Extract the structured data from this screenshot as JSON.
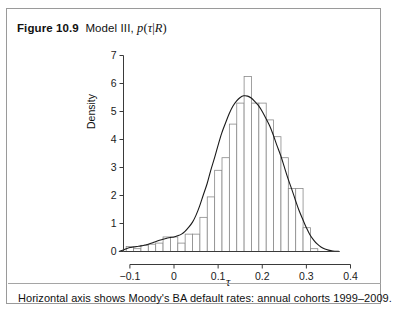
{
  "figure": {
    "number": "Figure 10.9",
    "title_prefix": "Model III,",
    "title_math_p": "p",
    "title_math_open": "(",
    "title_math_tau": "τ",
    "title_math_bar": "|",
    "title_math_R": "R",
    "title_math_close": ")",
    "bottom_caption": "Horizontal axis shows Moody's BA default rates: annual cohorts 1999–2009."
  },
  "chart_data": {
    "type": "bar",
    "xlabel": "τ",
    "ylabel": "Density",
    "xlim": [
      -0.125,
      0.4
    ],
    "ylim": [
      0,
      7.2
    ],
    "xticks": [
      -0.1,
      0,
      0.1,
      0.2,
      0.3,
      0.4
    ],
    "xticklabels": [
      "−0.1",
      "0",
      "0.1",
      "0.2",
      "0.3",
      "0.4"
    ],
    "yticks": [
      0,
      1,
      2,
      3,
      4,
      5,
      6,
      7
    ],
    "yticklabels": [
      "0",
      "1",
      "2",
      "3",
      "4",
      "5",
      "6",
      "7"
    ],
    "grid": false,
    "legend": false,
    "bar_color": "#ffffff",
    "bar_edge_color": "#8a8a8a",
    "curve_color": "#1a1a1a",
    "axis_color": "#3a3a3a",
    "bin_width": 0.0167,
    "bin_left_edges": [
      -0.1083,
      -0.0916,
      -0.0749,
      -0.0582,
      -0.0415,
      -0.0248,
      -0.0081,
      0.0086,
      0.0253,
      0.042,
      0.0587,
      0.0754,
      0.0921,
      0.1088,
      0.1255,
      0.1422,
      0.1589,
      0.1756,
      0.1923,
      0.209,
      0.2257,
      0.2424,
      0.2591,
      0.2758,
      0.2925,
      0.3092
    ],
    "values": [
      0.18,
      0.1,
      0.22,
      0.26,
      0.3,
      0.52,
      0.52,
      0.3,
      0.62,
      0.62,
      1.22,
      1.95,
      2.9,
      3.35,
      4.55,
      5.3,
      6.25,
      5.3,
      5.3,
      4.7,
      4.1,
      3.35,
      2.25,
      2.25,
      0.85,
      0.1
    ],
    "density_curve": {
      "name": "smoothed posterior density",
      "x": [
        -0.125,
        -0.115,
        -0.108,
        -0.1,
        -0.092,
        -0.084,
        -0.075,
        -0.066,
        -0.058,
        -0.05,
        -0.042,
        -0.033,
        -0.025,
        -0.017,
        -0.008,
        0.0,
        0.008,
        0.017,
        0.025,
        0.033,
        0.042,
        0.05,
        0.058,
        0.066,
        0.075,
        0.083,
        0.092,
        0.1,
        0.108,
        0.117,
        0.125,
        0.133,
        0.142,
        0.15,
        0.158,
        0.167,
        0.175,
        0.183,
        0.192,
        0.2,
        0.208,
        0.217,
        0.225,
        0.233,
        0.242,
        0.25,
        0.258,
        0.267,
        0.275,
        0.283,
        0.292,
        0.3,
        0.308,
        0.317,
        0.325,
        0.333,
        0.342,
        0.35,
        0.36,
        0.375
      ],
      "y": [
        0.0,
        0.05,
        0.1,
        0.14,
        0.16,
        0.18,
        0.2,
        0.23,
        0.26,
        0.3,
        0.35,
        0.4,
        0.44,
        0.47,
        0.5,
        0.52,
        0.56,
        0.62,
        0.72,
        0.86,
        1.05,
        1.3,
        1.62,
        2.0,
        2.42,
        2.88,
        3.35,
        3.8,
        4.22,
        4.6,
        4.92,
        5.18,
        5.38,
        5.5,
        5.56,
        5.55,
        5.48,
        5.36,
        5.2,
        5.0,
        4.76,
        4.48,
        4.16,
        3.8,
        3.42,
        3.02,
        2.62,
        2.22,
        1.84,
        1.48,
        1.14,
        0.85,
        0.6,
        0.4,
        0.26,
        0.16,
        0.09,
        0.05,
        0.02,
        0.0
      ]
    }
  }
}
